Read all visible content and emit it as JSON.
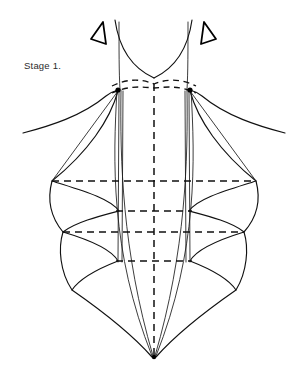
{
  "page": {
    "title": "Stage 1.",
    "background_color": "#ffffff",
    "ink_color": "#111111",
    "width": 307,
    "height": 384
  },
  "caption": {
    "label": "Stage 1.",
    "x": 24,
    "y": 60,
    "font_size_px": 9.5,
    "color": "#2b2b2b"
  },
  "diagram": {
    "name": "bodice-pattern-draft",
    "center_x": 154,
    "apex_y": 358,
    "markers": [
      {
        "name": "left-direction-marker",
        "glyph": "triangle-left",
        "points": "103,22 91,39 106,44"
      },
      {
        "name": "right-direction-marker",
        "glyph": "triangle-right",
        "points": "204,22 216,39 201,44"
      }
    ],
    "strap_lines": [
      {
        "name": "left-strap-outer",
        "path": "M 115,20 C 119,48 132,68 154,78"
      },
      {
        "name": "right-strap-outer",
        "path": "M 192,20 C 188,48 175,68 154,78"
      },
      {
        "name": "left-strap-inner",
        "path": "M 119,22 C 119,50 119,72 120,90"
      },
      {
        "name": "right-strap-inner",
        "path": "M 188,22 C 188,50 188,72 187,90"
      }
    ],
    "dashed_arcs": [
      {
        "name": "upper-neckline-arc",
        "path": "M 112,86 C 128,78 142,79 154,84 C 166,79 180,78 196,86"
      },
      {
        "name": "lower-bust-arc",
        "path": "M 112,93 C 130,85 142,87 154,88 C 166,87 178,85 196,93"
      }
    ],
    "horizontal_guides": [
      {
        "name": "bust-level-guide",
        "y": 181,
        "x1": 52,
        "x2": 256
      },
      {
        "name": "underbust-guide",
        "y": 211,
        "x1": 116,
        "x2": 192
      },
      {
        "name": "waist-level-guide",
        "y": 232,
        "x1": 63,
        "x2": 244
      },
      {
        "name": "hip-guide",
        "y": 261,
        "x1": 116,
        "x2": 192
      }
    ],
    "center_front_line": {
      "name": "center-front-dashed",
      "x": 154,
      "y1": 84,
      "y2": 356
    },
    "dart_lines": [
      {
        "name": "left-dart-outer",
        "path": "M 117,90 C 113,160 110,250 152,356"
      },
      {
        "name": "left-dart-inner",
        "path": "M 121,90 C 120,160 122,250 153,356"
      },
      {
        "name": "left-seam-vertical-a",
        "path": "M 119,91 L 118,262"
      },
      {
        "name": "left-seam-vertical-b",
        "path": "M 123,91 L 122,262"
      },
      {
        "name": "right-dart-outer",
        "path": "M 191,90 C 195,160 198,250 156,356"
      },
      {
        "name": "right-dart-inner",
        "path": "M 187,90 C 188,160 186,250 155,356"
      },
      {
        "name": "right-seam-vertical-a",
        "path": "M 189,91 L 190,262"
      },
      {
        "name": "right-seam-vertical-b",
        "path": "M 185,91 L 186,262"
      }
    ],
    "shoulder_curves": [
      {
        "name": "left-shoulder-curve",
        "path": "M 23,133 C 50,126 82,116 106,96 C 110,93 114,91 118,90"
      },
      {
        "name": "right-shoulder-curve",
        "path": "M 285,133 C 258,126 226,116 202,96 C 198,93 194,91 190,90"
      }
    ],
    "panel_lines": [
      {
        "name": "left-upper-panel",
        "path": "M 118,91 L 52,181"
      },
      {
        "name": "right-upper-panel",
        "path": "M 190,91 L 256,181"
      }
    ],
    "side_scallops": [
      {
        "name": "left-side-outer",
        "path": "M 118,91 C 110,120 88,152 52,181 C 80,190 110,198 119,211 C 100,216 76,222 63,232 C 90,240 112,250 118,261 C 100,268 80,278 72,290 C 95,306 130,332 152,357"
      },
      {
        "name": "right-side-outer",
        "path": "M 190,91 C 198,120 220,152 256,181 C 228,190 198,198 189,211 C 208,216 232,222 244,232 C 218,240 196,250 190,261 C 208,268 228,278 236,290 C 213,306 178,332 156,357"
      },
      {
        "name": "left-scallop-a",
        "path": "M 52,181 C 48,196 48,214 63,232"
      },
      {
        "name": "right-scallop-a",
        "path": "M 256,181 C 260,196 260,214 244,232"
      },
      {
        "name": "left-scallop-b",
        "path": "M 63,232 C 58,248 60,272 72,290"
      },
      {
        "name": "right-scallop-b",
        "path": "M 244,232 C 249,248 247,272 236,290"
      }
    ],
    "nodes": [
      {
        "name": "left-bust-point",
        "cx": 118,
        "cy": 90,
        "r": 2.6
      },
      {
        "name": "right-bust-point",
        "cx": 190,
        "cy": 90,
        "r": 2.6
      },
      {
        "name": "hem-apex-point",
        "cx": 154,
        "cy": 357,
        "r": 2.2
      }
    ]
  }
}
